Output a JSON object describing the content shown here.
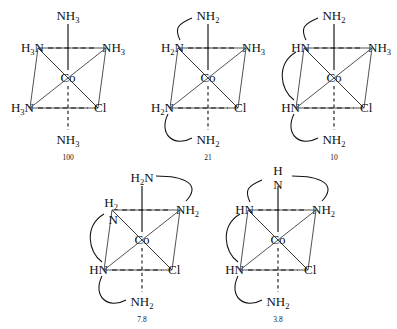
{
  "figure": {
    "kind": "chemical-structure-set",
    "metal_center": "Co",
    "background_color": "#ffffff",
    "line_color": "#111111"
  },
  "structures": [
    {
      "id": "structure-100",
      "caption": "100",
      "x": 6,
      "y": 2,
      "center": "Co",
      "ligands": {
        "top": {
          "base": "NH",
          "sub": "3"
        },
        "upper_left": {
          "base": "H",
          "sub": "3",
          "base2": "N",
          "pre": true
        },
        "upper_right": {
          "base": "NH",
          "sub": "3"
        },
        "lower_left": {
          "base": "H",
          "sub": "3",
          "base2": "N",
          "pre": true
        },
        "lower_right": {
          "base": "Cl",
          "sub": ""
        },
        "bottom": {
          "base": "NH",
          "sub": "3"
        }
      },
      "arcs": []
    },
    {
      "id": "structure-21",
      "caption": "21",
      "x": 146,
      "y": 2,
      "center": "Co",
      "ligands": {
        "top": {
          "base": "NH",
          "sub": "2"
        },
        "upper_left": {
          "base": "H",
          "sub": "2",
          "base2": "N",
          "pre": true
        },
        "upper_right": {
          "base": "NH",
          "sub": "3"
        },
        "lower_left": {
          "base": "H",
          "sub": "2",
          "base2": "N",
          "pre": true
        },
        "lower_right": {
          "base": "Cl",
          "sub": ""
        },
        "bottom": {
          "base": "NH",
          "sub": "2"
        }
      },
      "arcs": [
        "top-to-upperleft",
        "lowerleft-to-bottom"
      ]
    },
    {
      "id": "structure-10",
      "caption": "10",
      "x": 272,
      "y": 2,
      "center": "Co",
      "ligands": {
        "top": {
          "base": "NH",
          "sub": "2"
        },
        "upper_left": {
          "base": "HN",
          "sub": ""
        },
        "upper_right": {
          "base": "NH",
          "sub": "3"
        },
        "lower_left": {
          "base": "HN",
          "sub": ""
        },
        "lower_right": {
          "base": "Cl",
          "sub": ""
        },
        "bottom": {
          "base": "NH",
          "sub": "2"
        }
      },
      "arcs": [
        "top-to-upperleft",
        "upperleft-to-lowerleft",
        "lowerleft-to-bottom"
      ]
    },
    {
      "id": "structure-7-8",
      "caption": "7.8",
      "x": 80,
      "y": 164,
      "center": "Co",
      "ligands": {
        "top": {
          "base": "H",
          "sub": "2",
          "base2": "N",
          "pre": true
        },
        "upper_left": {
          "base": "H",
          "sub": "2",
          "base2": "N",
          "stacked": true
        },
        "upper_right": {
          "base": "NH",
          "sub": "2"
        },
        "lower_left": {
          "base": "HN",
          "sub": ""
        },
        "lower_right": {
          "base": "Cl",
          "sub": ""
        },
        "bottom": {
          "base": "NH",
          "sub": "2"
        }
      },
      "arcs": [
        "top-to-upperright",
        "upperleft-to-lowerleft",
        "lowerleft-to-bottom"
      ]
    },
    {
      "id": "structure-3-8",
      "caption": "3.8",
      "x": 216,
      "y": 164,
      "center": "Co",
      "ligands": {
        "top": {
          "base": "H",
          "sub": "",
          "base2": "N",
          "stacked": true
        },
        "upper_left": {
          "base": "HN",
          "sub": ""
        },
        "upper_right": {
          "base": "NH",
          "sub": "2"
        },
        "lower_left": {
          "base": "HN",
          "sub": ""
        },
        "lower_right": {
          "base": "Cl",
          "sub": ""
        },
        "bottom": {
          "base": "NH",
          "sub": "2"
        }
      },
      "arcs": [
        "top-to-upperleft",
        "top-to-upperright",
        "upperleft-to-lowerleft",
        "lowerleft-to-bottom"
      ]
    }
  ]
}
